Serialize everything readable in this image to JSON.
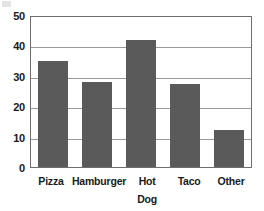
{
  "chart_data": {
    "type": "bar",
    "title": "",
    "subtitle": "",
    "xlabel": "",
    "ylabel": "",
    "categories": [
      "Pizza",
      "Hamburger",
      "Hot\nDog",
      "Taco",
      "Other"
    ],
    "values": [
      35.2,
      28.3,
      42.4,
      27.6,
      12.2
    ],
    "ylim": [
      0,
      50
    ],
    "y_ticks": [
      "0",
      "10",
      "20",
      "30",
      "40",
      "50"
    ],
    "y_tick_values": [
      0,
      10,
      20,
      30,
      40,
      50
    ],
    "grid": "horizontal",
    "legend": "none",
    "bar_color": "#5a5a5a",
    "grid_color": "#9a9a9a",
    "axis_color": "#6e6e6e",
    "background_color": "#ffffff",
    "text_color": "#1a1a1a"
  }
}
